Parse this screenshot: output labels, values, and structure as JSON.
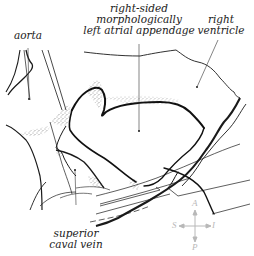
{
  "diagram": {
    "type": "anatomical line drawing",
    "labels": {
      "aorta": "aorta",
      "appendage_line1": "right-sided",
      "appendage_line2": "morphologically",
      "appendage_line3": "left atrial appendage",
      "ventricle_line1": "right",
      "ventricle_line2": "ventricle",
      "svc_line1": "superior",
      "svc_line2": "caval vein"
    },
    "orientation_compass": {
      "top": "A",
      "bottom": "P",
      "left": "S",
      "right": "I"
    },
    "colors": {
      "ink": "#1a1a1a",
      "compass": "#b8b8b8",
      "background": "#ffffff"
    }
  }
}
